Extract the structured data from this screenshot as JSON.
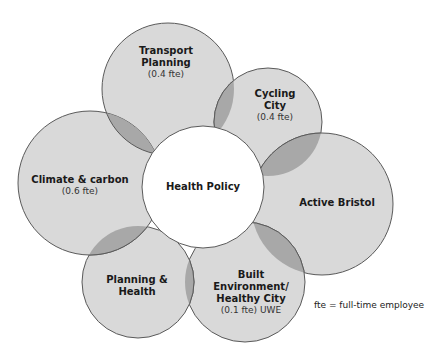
{
  "colors": {
    "circle_fill": "#d9d9d9",
    "overlap_fill": "#a8a8a8",
    "stroke": "#5a5a5a",
    "center_fill": "#ffffff"
  },
  "center": {
    "title": "Health Policy"
  },
  "petals": [
    {
      "id": "transport",
      "title_lines": [
        "Transport",
        "Planning"
      ],
      "sub": "(0.4 fte)"
    },
    {
      "id": "cycling",
      "title_lines": [
        "Cycling",
        "City"
      ],
      "sub": "(0.4 fte)"
    },
    {
      "id": "active-bristol",
      "title_lines": [
        "Active Bristol"
      ],
      "sub": ""
    },
    {
      "id": "built-environment",
      "title_lines": [
        "Built",
        "Environment/",
        "Healthy City"
      ],
      "sub": "(0.1 fte) UWE"
    },
    {
      "id": "planning-health",
      "title_lines": [
        "Planning &",
        "Health"
      ],
      "sub": ""
    },
    {
      "id": "climate",
      "title_lines": [
        "Climate & carbon"
      ],
      "sub": "(0.6 fte)"
    }
  ],
  "legend_note": "fte = full-time employee"
}
